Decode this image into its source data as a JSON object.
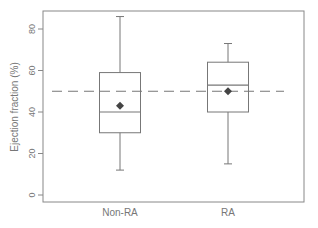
{
  "chart_data": {
    "type": "box",
    "title": "",
    "xlabel": "",
    "ylabel": "Ejection fraction (%)",
    "ylim": [
      -4,
      88
    ],
    "yticks": [
      0,
      20,
      40,
      60,
      80
    ],
    "grid": false,
    "categories": [
      "Non-RA",
      "RA"
    ],
    "boxes": [
      {
        "name": "Non-RA",
        "whisker_low": 12,
        "q1": 30,
        "median": 40,
        "q3": 59,
        "whisker_high": 86,
        "mean": 43
      },
      {
        "name": "RA",
        "whisker_low": 15,
        "q1": 40,
        "median": 53,
        "q3": 64,
        "whisker_high": 73,
        "mean": 50
      }
    ],
    "reference_line": {
      "y": 50,
      "style": "dashed"
    },
    "colors": {
      "axis": "#888888",
      "box": "#777777",
      "mean_marker": "#444444",
      "reference": "#777777"
    }
  }
}
